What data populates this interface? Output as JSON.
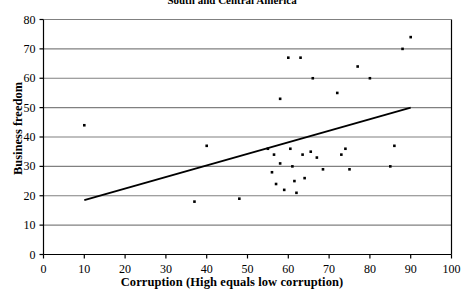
{
  "chart_data": {
    "type": "scatter",
    "title": "South and Central America",
    "xlabel": "Corruption (High equals low corruption)",
    "ylabel": "Business freedom",
    "xlim": [
      0,
      100
    ],
    "ylim": [
      0,
      80
    ],
    "xticks": [
      0,
      10,
      20,
      30,
      40,
      50,
      60,
      70,
      80,
      90,
      100
    ],
    "yticks": [
      0,
      10,
      20,
      30,
      40,
      50,
      60,
      70,
      80
    ],
    "grid": "horizontal",
    "legend": null,
    "points": [
      {
        "x": 10,
        "y": 44
      },
      {
        "x": 37,
        "y": 18
      },
      {
        "x": 40,
        "y": 37
      },
      {
        "x": 48,
        "y": 19
      },
      {
        "x": 55,
        "y": 36
      },
      {
        "x": 56,
        "y": 28
      },
      {
        "x": 56.5,
        "y": 34
      },
      {
        "x": 57,
        "y": 24
      },
      {
        "x": 58,
        "y": 53
      },
      {
        "x": 58,
        "y": 31
      },
      {
        "x": 59,
        "y": 22
      },
      {
        "x": 60,
        "y": 67
      },
      {
        "x": 60.5,
        "y": 36
      },
      {
        "x": 61,
        "y": 30
      },
      {
        "x": 61.5,
        "y": 25
      },
      {
        "x": 62,
        "y": 21
      },
      {
        "x": 63,
        "y": 67
      },
      {
        "x": 63.5,
        "y": 34
      },
      {
        "x": 64,
        "y": 26
      },
      {
        "x": 65.5,
        "y": 35
      },
      {
        "x": 66,
        "y": 60
      },
      {
        "x": 67,
        "y": 33
      },
      {
        "x": 68.5,
        "y": 29
      },
      {
        "x": 72,
        "y": 55
      },
      {
        "x": 73,
        "y": 34
      },
      {
        "x": 74,
        "y": 36
      },
      {
        "x": 75,
        "y": 29
      },
      {
        "x": 77,
        "y": 64
      },
      {
        "x": 80,
        "y": 60
      },
      {
        "x": 85,
        "y": 30
      },
      {
        "x": 86,
        "y": 37
      },
      {
        "x": 88,
        "y": 70
      },
      {
        "x": 90,
        "y": 74
      }
    ],
    "trendline": {
      "x0": 10,
      "y0": 18.5,
      "x1": 90,
      "y1": 50
    },
    "colors": {
      "marker": "#000000",
      "trendline": "#000000",
      "gridline": "#808080",
      "axis": "#000000",
      "background": "#ffffff"
    }
  }
}
